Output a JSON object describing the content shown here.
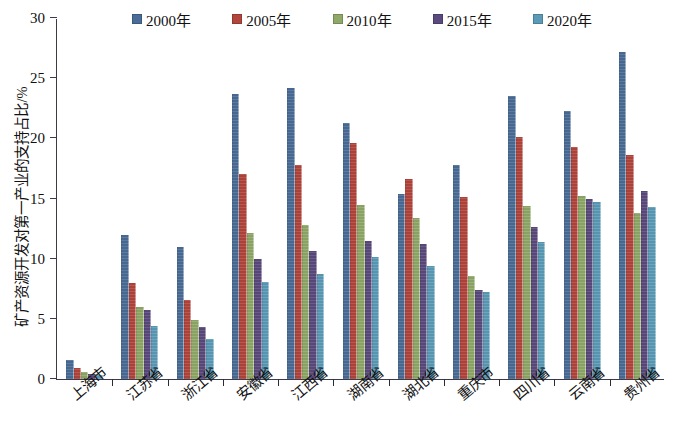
{
  "chart_data": {
    "type": "bar",
    "title": "",
    "xlabel": "",
    "ylabel": "矿产资源开发对第一产业的支持占比/%",
    "ylim": [
      0,
      30
    ],
    "yticks": [
      0,
      5,
      10,
      15,
      20,
      25,
      30
    ],
    "grid": false,
    "legend_position": "top",
    "categories": [
      "上海市",
      "江苏省",
      "浙江省",
      "安徽省",
      "江西省",
      "湖南省",
      "湖北省",
      "重庆市",
      "四川省",
      "云南省",
      "贵州省"
    ],
    "series": [
      {
        "name": "2000年",
        "color": "#4a6c96",
        "values": [
          1.6,
          12.0,
          11.0,
          23.7,
          24.2,
          21.3,
          15.4,
          17.8,
          23.5,
          22.3,
          27.2
        ]
      },
      {
        "name": "2005年",
        "color": "#b2453c",
        "values": [
          0.9,
          8.0,
          6.6,
          17.0,
          17.8,
          19.6,
          16.6,
          15.1,
          20.1,
          19.3,
          18.6
        ]
      },
      {
        "name": "2010年",
        "color": "#8fa968",
        "values": [
          0.6,
          6.0,
          4.9,
          12.1,
          12.8,
          14.5,
          13.4,
          8.6,
          14.4,
          15.2,
          13.8
        ]
      },
      {
        "name": "2015年",
        "color": "#5a4a7d",
        "values": [
          0.4,
          5.7,
          4.3,
          10.0,
          10.6,
          11.5,
          11.2,
          7.4,
          12.6,
          15.0,
          15.6
        ]
      },
      {
        "name": "2020年",
        "color": "#5b9bb7",
        "values": [
          0.3,
          4.4,
          3.3,
          8.1,
          8.7,
          10.1,
          9.4,
          7.2,
          11.4,
          14.7,
          14.3
        ]
      }
    ]
  }
}
